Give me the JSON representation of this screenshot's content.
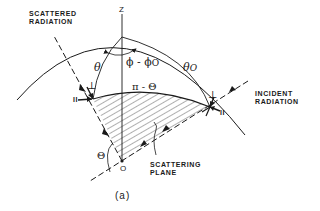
{
  "figure": {
    "caption": "(a)",
    "labels": {
      "scattered_radiation": "SCATTERED\nRADIATION",
      "incident_radiation": "INCIDENT\nRADIATION",
      "scattering_plane": "SCATTERING\nPLANE",
      "z_axis": "Z",
      "origin": "O",
      "theta": "θ",
      "theta_0": "θ",
      "theta_0_sub": "O",
      "phi_diff": "ϕ - ϕ",
      "phi_diff_sub": "O",
      "pi_minus_theta": "π - Θ",
      "scatter_angle": "Θ",
      "parallel_left": "II",
      "perp_left": "⊥",
      "parallel_right": "II",
      "perp_right": "⊥"
    },
    "colors": {
      "ink": "#1a1a1a",
      "background": "#ffffff"
    }
  }
}
